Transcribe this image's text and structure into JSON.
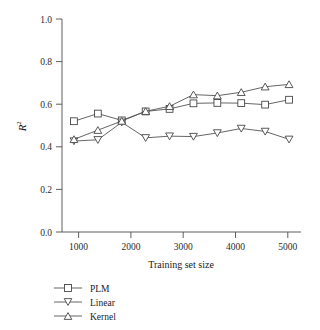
{
  "chart_data": {
    "type": "line",
    "title": "",
    "xlabel": "Training set size",
    "ylabel": "R^2",
    "ylabel_base": "R",
    "ylabel_exponent": "2",
    "x": [
      500,
      1000,
      1500,
      2000,
      2500,
      3000,
      3500,
      4000,
      4500,
      5000
    ],
    "xlim": [
      250,
      5250
    ],
    "ylim": [
      0.0,
      1.0
    ],
    "xticks": [
      1000,
      2000,
      3000,
      4000,
      5000
    ],
    "xtick_labels": [
      "1000",
      "2000",
      "3000",
      "4000",
      "5000"
    ],
    "yticks": [
      0.0,
      0.2,
      0.4,
      0.6,
      0.8,
      1.0
    ],
    "ytick_labels": [
      "0.0",
      "0.2",
      "0.4",
      "0.6",
      "0.8",
      "1.0"
    ],
    "grid": false,
    "legend_position": "below-left",
    "series": [
      {
        "name": "PLM",
        "marker": "square",
        "values": [
          0.52,
          0.556,
          0.524,
          0.566,
          0.578,
          0.604,
          0.606,
          0.605,
          0.598,
          0.621
        ]
      },
      {
        "name": "Linear",
        "marker": "triangle-down",
        "values": [
          0.427,
          0.433,
          0.515,
          0.442,
          0.45,
          0.448,
          0.465,
          0.486,
          0.472,
          0.435
        ]
      },
      {
        "name": "Kernel",
        "marker": "triangle-up",
        "values": [
          0.435,
          0.478,
          0.521,
          0.567,
          0.59,
          0.645,
          0.64,
          0.656,
          0.682,
          0.693
        ]
      }
    ],
    "colors": {
      "line": "#4a4a4a",
      "marker_fill": "#ffffff",
      "marker_stroke": "#3d3d3d",
      "axis": "#4d4d4d",
      "text": "#1a1a1a",
      "background": "#ffffff"
    }
  },
  "legend": {
    "items": [
      {
        "label": "PLM",
        "marker": "square"
      },
      {
        "label": "Linear",
        "marker": "triangle-down"
      },
      {
        "label": "Kernel",
        "marker": "triangle-up"
      }
    ]
  }
}
